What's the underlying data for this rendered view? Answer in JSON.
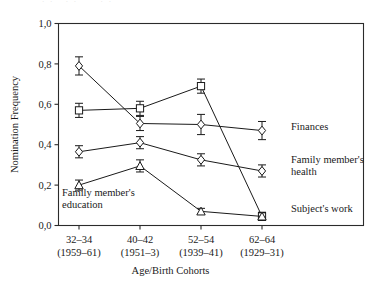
{
  "chart_data": {
    "type": "line",
    "title": "",
    "subtitle": "",
    "xlabel": "Age/Birth Cohorts",
    "ylabel": "Nomination Frequency",
    "grid": false,
    "legend_position": "right-inline",
    "ylim": [
      0.0,
      1.0
    ],
    "ytick_values": [
      0.0,
      0.2,
      0.4,
      0.6,
      0.8,
      1.0
    ],
    "ytick_labels": [
      "0,0",
      "0,2",
      "0,4",
      "0,6",
      "0,8",
      "1,0"
    ],
    "categories": [
      "32–34",
      "40–42",
      "52–54",
      "62–64"
    ],
    "category_sublabels": [
      "(1959–61)",
      "(1951–3)",
      "(1939–41)",
      "(1929–31)"
    ],
    "x": [
      1,
      2,
      3,
      4
    ],
    "series": [
      {
        "name": "Family member's health",
        "marker": "diamond",
        "label_position": "right",
        "values": [
          0.79,
          0.505,
          0.5,
          0.47
        ],
        "errors": [
          0.045,
          0.035,
          0.05,
          0.045
        ]
      },
      {
        "name": "Subject's work",
        "marker": "square",
        "label_position": "right",
        "values": [
          0.57,
          0.58,
          0.69,
          0.045
        ],
        "errors": [
          0.035,
          0.035,
          0.035,
          0.02
        ]
      },
      {
        "name": "Finances",
        "marker": "diamond",
        "label_position": "right",
        "values": [
          0.365,
          0.41,
          0.325,
          0.27
        ],
        "errors": [
          0.03,
          0.03,
          0.03,
          0.03
        ]
      },
      {
        "name": "Family member's education",
        "marker": "triangle",
        "label_position": "inside-lower-left",
        "values": [
          0.2,
          0.295,
          0.07,
          0.045
        ],
        "errors": [
          0.025,
          0.03,
          0.015,
          0.02
        ]
      }
    ],
    "annotations": [
      {
        "text": "Finances",
        "x_px": 291,
        "y_px": 130
      },
      {
        "text": "Family member's",
        "x_px": 291,
        "y_px": 163
      },
      {
        "text": "health",
        "x_px": 291,
        "y_px": 175
      },
      {
        "text": "Subject's work",
        "x_px": 291,
        "y_px": 212
      },
      {
        "text": "Family member's",
        "x_px": 62,
        "y_px": 196
      },
      {
        "text": "education",
        "x_px": 62,
        "y_px": 208
      }
    ]
  },
  "colors": {
    "axis": "#2b2b2b",
    "line": "#1a1a1a",
    "marker_fill": "#ffffff",
    "background": "#ffffff"
  }
}
